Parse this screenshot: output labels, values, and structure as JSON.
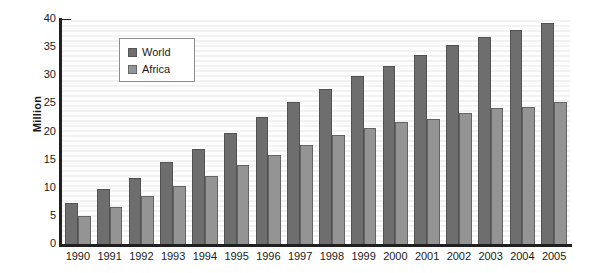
{
  "chart_data": {
    "type": "bar",
    "title": "",
    "subtitle": "",
    "xlabel": "",
    "ylabel": "Million",
    "ylim": [
      0,
      40
    ],
    "xlim_categories": 16,
    "grid": "horizontal-stripes",
    "legend_position": "top-left-inside",
    "y_major_step": 5,
    "y_minor_step": 1,
    "categories": [
      "1990",
      "1991",
      "1992",
      "1993",
      "1994",
      "1995",
      "1996",
      "1997",
      "1998",
      "1999",
      "2000",
      "2001",
      "2002",
      "2003",
      "2004",
      "2005"
    ],
    "ytick_labels": [
      "40",
      "35",
      "30",
      "25",
      "20",
      "15",
      "10",
      "5",
      "0"
    ],
    "ytick_values": [
      40,
      35,
      30,
      25,
      20,
      15,
      10,
      5,
      0
    ],
    "series": [
      {
        "name": "World",
        "color": "#6e6e6e",
        "values": [
          7.5,
          10.0,
          12.0,
          14.7,
          17.0,
          20.0,
          22.8,
          25.5,
          27.8,
          30.0,
          31.8,
          33.8,
          35.5,
          37.0,
          38.3,
          39.5
        ]
      },
      {
        "name": "Africa",
        "color": "#949494",
        "values": [
          5.2,
          6.8,
          8.8,
          10.5,
          12.3,
          14.2,
          16.0,
          17.8,
          19.6,
          20.8,
          21.8,
          22.4,
          23.5,
          24.3,
          24.5,
          25.5
        ]
      }
    ]
  },
  "legend": {
    "items": [
      {
        "label": "World",
        "swatch": "world"
      },
      {
        "label": "Africa",
        "swatch": "africa"
      }
    ]
  }
}
